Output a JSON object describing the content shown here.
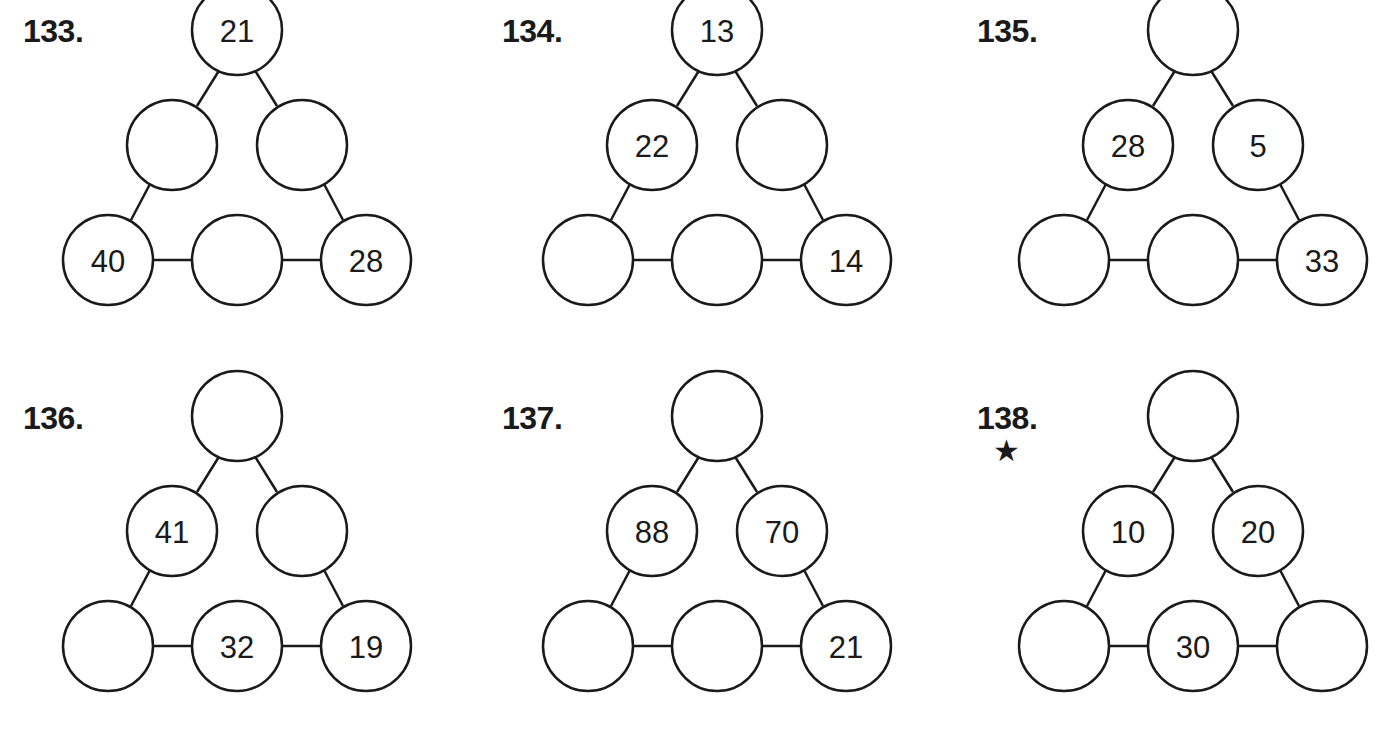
{
  "puzzles": [
    {
      "label": "133.",
      "star": "",
      "top": "21",
      "mid_left": "",
      "mid_right": "",
      "bottom_left": "40",
      "bottom_mid": "",
      "bottom_right": "28"
    },
    {
      "label": "134.",
      "star": "",
      "top": "13",
      "mid_left": "22",
      "mid_right": "",
      "bottom_left": "",
      "bottom_mid": "",
      "bottom_right": "14"
    },
    {
      "label": "135.",
      "star": "",
      "top": "",
      "mid_left": "28",
      "mid_right": "5",
      "bottom_left": "",
      "bottom_mid": "",
      "bottom_right": "33"
    },
    {
      "label": "136.",
      "star": "",
      "top": "",
      "mid_left": "41",
      "mid_right": "",
      "bottom_left": "",
      "bottom_mid": "32",
      "bottom_right": "19"
    },
    {
      "label": "137.",
      "star": "",
      "top": "",
      "mid_left": "88",
      "mid_right": "70",
      "bottom_left": "",
      "bottom_mid": "",
      "bottom_right": "21"
    },
    {
      "label": "138.",
      "star": "★",
      "top": "",
      "mid_left": "10",
      "mid_right": "20",
      "bottom_left": "",
      "bottom_mid": "30",
      "bottom_right": ""
    }
  ],
  "colors": {
    "stroke": "#1a1a1a",
    "background": "#ffffff"
  }
}
